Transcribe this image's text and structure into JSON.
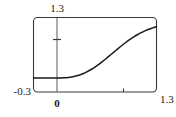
{
  "figure": {
    "name": "cumulative-distribution-plot",
    "background_color": "#ffffff",
    "frame_color": "#3a3a3a",
    "curve_color": "#1a1a1a"
  },
  "labels": {
    "y_max": "1.3",
    "y_min": "-0.3",
    "x_min": "0",
    "x_max": "1.3"
  },
  "chart_data": {
    "type": "line",
    "title": "",
    "xlabel": "",
    "ylabel": "",
    "xlim": [
      -0.3,
      1.3
    ],
    "ylim": [
      -0.3,
      1.3
    ],
    "xticks": [
      0,
      1.0
    ],
    "xticklabels": [
      "0",
      ""
    ],
    "yticks": [
      0,
      1.0
    ],
    "yticklabels": [
      "",
      ""
    ],
    "grid": false,
    "legend": null,
    "frame": true,
    "axis_origin": [
      0,
      0
    ],
    "series": [
      {
        "name": "curve",
        "x": [
          -0.3,
          -0.2,
          -0.1,
          0.0,
          0.05,
          0.1,
          0.15,
          0.2,
          0.25,
          0.3,
          0.35,
          0.4,
          0.45,
          0.5,
          0.55,
          0.6,
          0.65,
          0.7,
          0.75,
          0.8,
          0.85,
          0.9,
          0.95,
          1.0,
          1.05,
          1.1,
          1.15,
          1.2,
          1.25,
          1.3
        ],
        "y": [
          0.0,
          0.0,
          0.0,
          0.0,
          0.0,
          0.005,
          0.012,
          0.024,
          0.042,
          0.066,
          0.098,
          0.137,
          0.183,
          0.236,
          0.295,
          0.358,
          0.425,
          0.494,
          0.563,
          0.632,
          0.699,
          0.763,
          0.823,
          0.878,
          0.929,
          0.974,
          1.013,
          1.047,
          1.077,
          1.105
        ]
      }
    ]
  }
}
